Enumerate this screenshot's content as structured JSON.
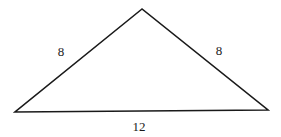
{
  "diagram": {
    "type": "isosceles-triangle",
    "vertices": {
      "apex": [
        142,
        9
      ],
      "left": [
        15,
        112
      ],
      "right": [
        268,
        110
      ]
    },
    "sides": {
      "left": {
        "label": "8",
        "pos": [
          61,
          56
        ]
      },
      "right": {
        "label": "8",
        "pos": [
          219,
          55
        ]
      },
      "base": {
        "label": "12",
        "pos": [
          139,
          131
        ]
      }
    },
    "stroke_color": "#1a1a1a",
    "background": "#ffffff"
  }
}
